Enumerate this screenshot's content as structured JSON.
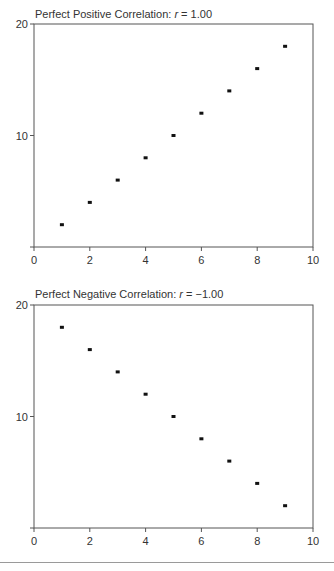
{
  "chart_data": [
    {
      "type": "scatter",
      "title": "Perfect Positive Correlation: r = 1.00",
      "title_prefix": "Perfect Positive Correlation: ",
      "title_r": "r",
      "title_suffix": " = 1.00",
      "xlabel": "",
      "ylabel": "",
      "xlim": [
        0,
        10
      ],
      "ylim": [
        0,
        20
      ],
      "x_ticks": [
        0,
        2,
        4,
        6,
        8,
        10
      ],
      "y_ticks": [
        10,
        20
      ],
      "grid": false,
      "legend": null,
      "series": [
        {
          "name": "positive",
          "x": [
            1,
            2,
            3,
            4,
            5,
            6,
            7,
            8,
            9
          ],
          "y": [
            2,
            4,
            6,
            8,
            10,
            12,
            14,
            16,
            18
          ]
        }
      ]
    },
    {
      "type": "scatter",
      "title": "Perfect Negative Correlation: r = −1.00",
      "title_prefix": "Perfect Negative Correlation: ",
      "title_r": "r",
      "title_suffix": " = −1.00",
      "xlabel": "",
      "ylabel": "",
      "xlim": [
        0,
        10
      ],
      "ylim": [
        0,
        20
      ],
      "x_ticks": [
        0,
        2,
        4,
        6,
        8,
        10
      ],
      "y_ticks": [
        10,
        20
      ],
      "grid": false,
      "legend": null,
      "series": [
        {
          "name": "negative",
          "x": [
            1,
            2,
            3,
            4,
            5,
            6,
            7,
            8,
            9
          ],
          "y": [
            18,
            16,
            14,
            12,
            10,
            8,
            6,
            4,
            2
          ]
        }
      ]
    }
  ]
}
